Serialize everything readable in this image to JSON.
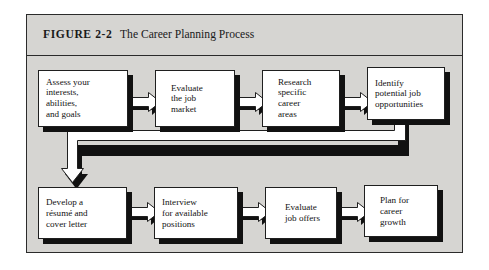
{
  "figure": {
    "label": "FIGURE 2-2",
    "title": "The Career Planning Process"
  },
  "colors": {
    "panel_background": "#d6d5d2",
    "box_fill": "#ffffff",
    "ink": "#111111",
    "shadow": "#111111",
    "page_background": "#ffffff"
  },
  "diagram": {
    "type": "flowchart",
    "flow_direction": "left-to-right, wrapping to a second row",
    "row1": [
      {
        "step": 1,
        "name": "assess",
        "text": "Assess your\ninterests,\nabilities,\nand goals"
      },
      {
        "step": 2,
        "name": "evaluate-market",
        "text": "Evaluate\nthe job\nmarket"
      },
      {
        "step": 3,
        "name": "research-careers",
        "text": "Research\nspecific\ncareer\nareas"
      },
      {
        "step": 4,
        "name": "identify-jobs",
        "text": "Identify\npotential job\nopportunities"
      }
    ],
    "row2": [
      {
        "step": 5,
        "name": "develop-resume",
        "text": "Develop a\nrésumé and\ncover letter"
      },
      {
        "step": 6,
        "name": "interview",
        "text": "Interview\nfor available\npositions"
      },
      {
        "step": 7,
        "name": "evaluate-offers",
        "text": "Evaluate\njob offers"
      },
      {
        "step": 8,
        "name": "plan-growth",
        "text": "Plan for\ncareer\ngrowth"
      }
    ],
    "connectors": {
      "row1_arrows": 3,
      "row2_arrows": 3,
      "wrap_connector": "from step 4 down, left across the chart, then down into step 5"
    }
  }
}
